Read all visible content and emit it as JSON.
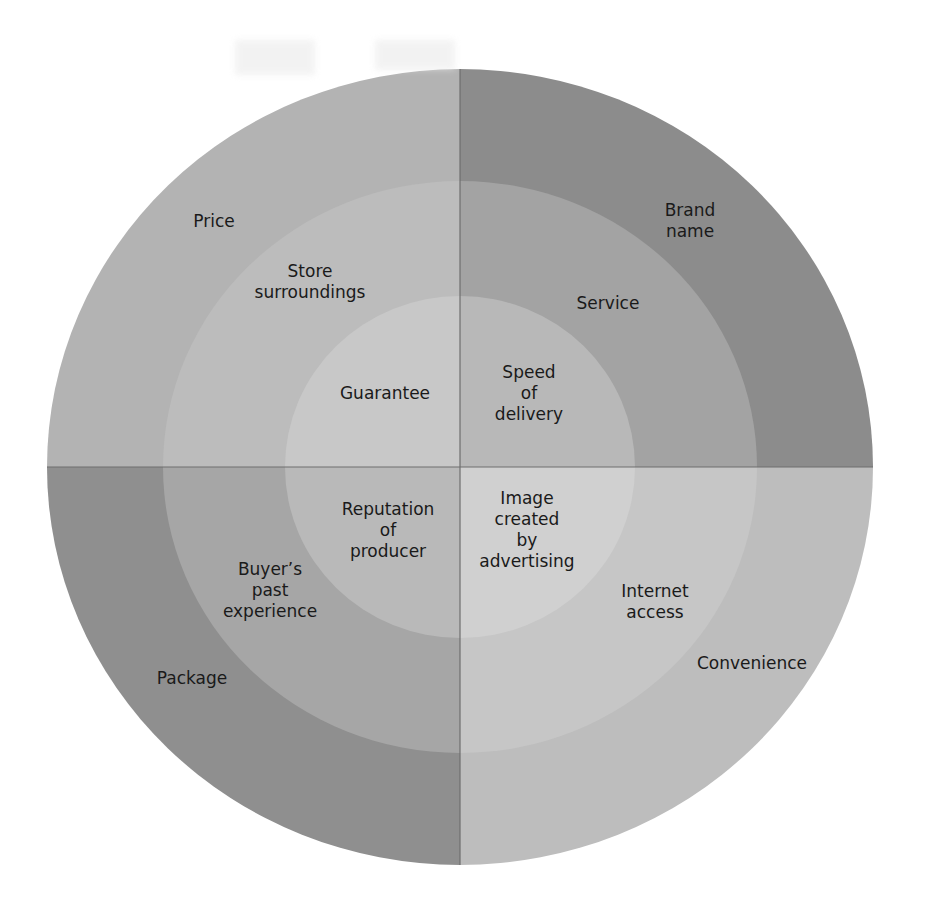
{
  "diagram": {
    "type": "concentric-quadrant-wheel",
    "center": {
      "x": 460,
      "y": 467
    },
    "rings": [
      {
        "name": "outer",
        "rx": 413,
        "ry": 398
      },
      {
        "name": "middle",
        "rx": 297,
        "ry": 286
      },
      {
        "name": "inner",
        "rx": 175,
        "ry": 171
      }
    ],
    "quadrants": [
      {
        "position": "top-left",
        "colors": {
          "outer": "#b3b3b3",
          "middle": "#bcbcbc",
          "inner": "#c8c8c8"
        },
        "labels": {
          "outer": "Price",
          "middle": "Store\nsurroundings",
          "inner": "Guarantee"
        }
      },
      {
        "position": "top-right",
        "colors": {
          "outer": "#8c8c8c",
          "middle": "#a3a3a3",
          "inner": "#b8b8b8"
        },
        "labels": {
          "outer": "Brand\nname",
          "middle": "Service",
          "inner": "Speed\nof\ndelivery"
        }
      },
      {
        "position": "bottom-left",
        "colors": {
          "outer": "#8f8f8f",
          "middle": "#a6a6a6",
          "inner": "#b9b9b9"
        },
        "labels": {
          "outer": "Package",
          "middle": "Buyer’s\npast\nexperience",
          "inner": "Reputation\nof\nproducer"
        }
      },
      {
        "position": "bottom-right",
        "colors": {
          "outer": "#bdbdbd",
          "middle": "#c6c6c6",
          "inner": "#d0d0d0"
        },
        "labels": {
          "outer": "Convenience",
          "middle": "Internet\naccess",
          "inner": "Image\ncreated\nby\nadvertising"
        }
      }
    ],
    "divider_color": "#6e6e6e"
  }
}
